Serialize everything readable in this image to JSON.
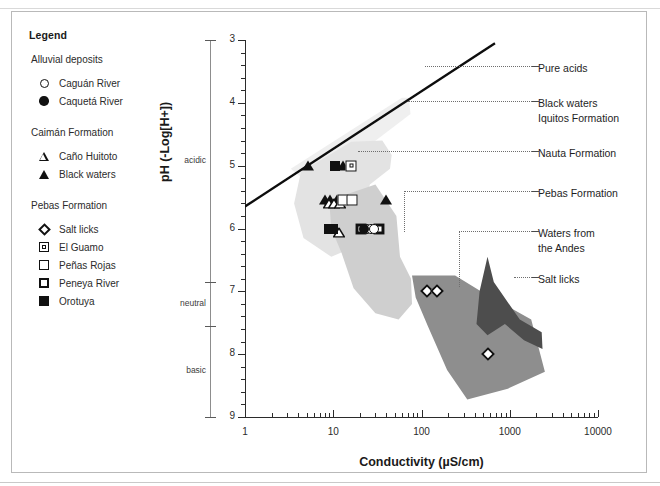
{
  "legend": {
    "title": "Legend",
    "groups": [
      {
        "title": "Alluvial deposits",
        "items": [
          {
            "symbol": "circle-open",
            "label": "Caguán River"
          },
          {
            "symbol": "circle-filled",
            "label": "Caquetá River"
          }
        ]
      },
      {
        "title": "Caimán Formation",
        "items": [
          {
            "symbol": "triangle-open",
            "label": "Caño Huitoto"
          },
          {
            "symbol": "triangle-filled",
            "label": "Black waters"
          }
        ]
      },
      {
        "title": "Pebas Formation",
        "items": [
          {
            "symbol": "diamond-open",
            "label": "Salt licks"
          },
          {
            "symbol": "square-dotted",
            "label": "El Guamo"
          },
          {
            "symbol": "square-open",
            "label": "Peñas Rojas"
          },
          {
            "symbol": "square-thick",
            "label": "Peneya River"
          },
          {
            "symbol": "square-filled",
            "label": "Orotuya"
          }
        ]
      }
    ]
  },
  "ph_zones": [
    {
      "label": "acidic",
      "from": 3,
      "to": 6.85
    },
    {
      "label": "neutral",
      "from": 6.85,
      "to": 7.55
    },
    {
      "label": "basic",
      "from": 7.55,
      "to": 9
    }
  ],
  "callouts": [
    {
      "name": "pure-acids",
      "lines": [
        "Pure acids"
      ]
    },
    {
      "name": "black-waters-iquitos",
      "lines": [
        "Black waters",
        "Iquitos Formation"
      ]
    },
    {
      "name": "nauta-formation",
      "lines": [
        "Nauta Formation"
      ]
    },
    {
      "name": "pebas-formation",
      "lines": [
        "Pebas Formation"
      ]
    },
    {
      "name": "waters-from-the-andes",
      "lines": [
        "Waters from",
        "the Andes"
      ]
    },
    {
      "name": "salt-licks",
      "lines": [
        "Salt licks"
      ]
    }
  ],
  "colors": {
    "iquitos": "#efefef",
    "nauta": "#e3e3e3",
    "pebas": "#cfcfcf",
    "salt_licks": "#8e8e8e",
    "andes": "#4d4d4d",
    "axis": "#2b2b2b",
    "marker": "#111111"
  },
  "chart_data": {
    "type": "scatter",
    "title": "",
    "xlabel": "Conductivity (µS/cm)",
    "ylabel": "pH (-Log[H+])",
    "xscale": "log",
    "xlim": [
      1,
      10000
    ],
    "ylim": [
      3,
      9
    ],
    "y_inverted": true,
    "xticks": [
      1,
      10,
      100,
      1000,
      10000
    ],
    "xticklabels": [
      "1",
      "10",
      "100",
      "1000",
      "10000"
    ],
    "yticks": [
      3,
      4,
      5,
      6,
      7,
      8,
      9
    ],
    "yticklabels": [
      "3",
      "4",
      "5",
      "6",
      "7",
      "8",
      "9"
    ],
    "grid": false,
    "legend_position": "outside-left",
    "series": [
      {
        "name": "Black waters",
        "symbol": "triangle-filled",
        "points": [
          {
            "x": 5.2,
            "y": 5.0
          },
          {
            "x": 8.0,
            "y": 5.55
          },
          {
            "x": 9.3,
            "y": 5.55
          },
          {
            "x": 11.0,
            "y": 5.55
          },
          {
            "x": 13.0,
            "y": 5.0
          },
          {
            "x": 40.0,
            "y": 5.55
          }
        ]
      },
      {
        "name": "Caño Huitoto",
        "symbol": "triangle-open",
        "points": [
          {
            "x": 9.0,
            "y": 5.55
          },
          {
            "x": 10.2,
            "y": 5.55
          },
          {
            "x": 12.0,
            "y": 5.55
          },
          {
            "x": 11.5,
            "y": 6.0
          }
        ]
      },
      {
        "name": "Orotuya",
        "symbol": "square-filled",
        "points": [
          {
            "x": 10.5,
            "y": 5.0
          },
          {
            "x": 13.5,
            "y": 5.55
          },
          {
            "x": 9.0,
            "y": 6.0
          },
          {
            "x": 10.0,
            "y": 6.0
          }
        ]
      },
      {
        "name": "El Guamo",
        "symbol": "square-dotted",
        "points": [
          {
            "x": 16.0,
            "y": 5.0
          }
        ]
      },
      {
        "name": "Peñas Rojas",
        "symbol": "square-open",
        "points": [
          {
            "x": 13.0,
            "y": 5.55
          },
          {
            "x": 16.5,
            "y": 5.55
          }
        ]
      },
      {
        "name": "Peneya River",
        "symbol": "square-thick",
        "points": [
          {
            "x": 20.5,
            "y": 6.0
          },
          {
            "x": 33.0,
            "y": 6.0
          }
        ]
      },
      {
        "name": "Caguán River",
        "symbol": "circle-open",
        "points": [
          {
            "x": 24.0,
            "y": 6.0
          },
          {
            "x": 26.5,
            "y": 6.0
          },
          {
            "x": 29.0,
            "y": 6.0
          }
        ]
      },
      {
        "name": "Caquetá River",
        "symbol": "circle-filled",
        "points": [
          {
            "x": 22.5,
            "y": 6.0
          }
        ]
      },
      {
        "name": "Salt licks",
        "symbol": "diamond-open",
        "points": [
          {
            "x": 115.0,
            "y": 7.0
          },
          {
            "x": 150.0,
            "y": 7.0
          },
          {
            "x": 560.0,
            "y": 8.0
          }
        ]
      }
    ],
    "reference_line": {
      "name": "Pure acids",
      "from": {
        "x": 1.0,
        "y": 5.65
      },
      "to": {
        "x": 680.0,
        "y": 3.05
      }
    },
    "regions": [
      {
        "name": "Black waters Iquitos Formation",
        "fill": "#efefef",
        "pattern": "dotted"
      },
      {
        "name": "Nauta Formation",
        "fill": "#e3e3e3"
      },
      {
        "name": "Pebas Formation",
        "fill": "#cfcfcf"
      },
      {
        "name": "Salt licks",
        "fill": "#8e8e8e"
      },
      {
        "name": "Waters from the Andes",
        "fill": "#4d4d4d"
      }
    ]
  }
}
